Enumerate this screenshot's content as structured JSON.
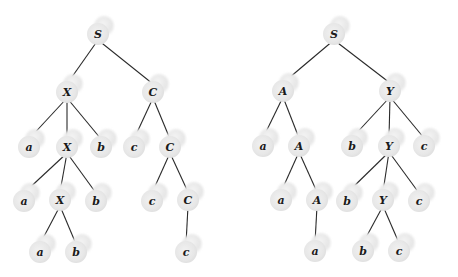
{
  "diagram": {
    "type": "parse-trees",
    "trees": [
      {
        "name": "left-tree",
        "nodes": [
          {
            "id": "L_S",
            "label": "S",
            "x": 98,
            "y": 34
          },
          {
            "id": "L_X1",
            "label": "X",
            "x": 67,
            "y": 92
          },
          {
            "id": "L_C1",
            "label": "C",
            "x": 153,
            "y": 92
          },
          {
            "id": "L_a1",
            "label": "a",
            "x": 29,
            "y": 147
          },
          {
            "id": "L_X2",
            "label": "X",
            "x": 67,
            "y": 147
          },
          {
            "id": "L_b1",
            "label": "b",
            "x": 101,
            "y": 147
          },
          {
            "id": "L_c1",
            "label": "c",
            "x": 134,
            "y": 147
          },
          {
            "id": "L_C2",
            "label": "C",
            "x": 170,
            "y": 147
          },
          {
            "id": "L_a2",
            "label": "a",
            "x": 24,
            "y": 201
          },
          {
            "id": "L_X3",
            "label": "X",
            "x": 60,
            "y": 200
          },
          {
            "id": "L_b2",
            "label": "b",
            "x": 96,
            "y": 201
          },
          {
            "id": "L_c2",
            "label": "c",
            "x": 152,
            "y": 201
          },
          {
            "id": "L_C3",
            "label": "C",
            "x": 188,
            "y": 200
          },
          {
            "id": "L_a3",
            "label": "a",
            "x": 40,
            "y": 252
          },
          {
            "id": "L_b3",
            "label": "b",
            "x": 76,
            "y": 252
          },
          {
            "id": "L_c3",
            "label": "c",
            "x": 186,
            "y": 252
          }
        ],
        "edges": [
          [
            "L_S",
            "L_X1"
          ],
          [
            "L_S",
            "L_C1"
          ],
          [
            "L_X1",
            "L_a1"
          ],
          [
            "L_X1",
            "L_X2"
          ],
          [
            "L_X1",
            "L_b1"
          ],
          [
            "L_C1",
            "L_c1"
          ],
          [
            "L_C1",
            "L_C2"
          ],
          [
            "L_X2",
            "L_a2"
          ],
          [
            "L_X2",
            "L_X3"
          ],
          [
            "L_X2",
            "L_b2"
          ],
          [
            "L_C2",
            "L_c2"
          ],
          [
            "L_C2",
            "L_C3"
          ],
          [
            "L_X3",
            "L_a3"
          ],
          [
            "L_X3",
            "L_b3"
          ],
          [
            "L_C3",
            "L_c3"
          ]
        ]
      },
      {
        "name": "right-tree",
        "nodes": [
          {
            "id": "R_S",
            "label": "S",
            "x": 334,
            "y": 34
          },
          {
            "id": "R_A1",
            "label": "A",
            "x": 283,
            "y": 91
          },
          {
            "id": "R_Y1",
            "label": "Y",
            "x": 390,
            "y": 91
          },
          {
            "id": "R_a1",
            "label": "a",
            "x": 263,
            "y": 146
          },
          {
            "id": "R_A2",
            "label": "A",
            "x": 299,
            "y": 146
          },
          {
            "id": "R_b1",
            "label": "b",
            "x": 352,
            "y": 146
          },
          {
            "id": "R_Y2",
            "label": "Y",
            "x": 389,
            "y": 146
          },
          {
            "id": "R_c1",
            "label": "c",
            "x": 424,
            "y": 146
          },
          {
            "id": "R_a2",
            "label": "a",
            "x": 281,
            "y": 200
          },
          {
            "id": "R_A3",
            "label": "A",
            "x": 317,
            "y": 200
          },
          {
            "id": "R_b2",
            "label": "b",
            "x": 347,
            "y": 201
          },
          {
            "id": "R_Y3",
            "label": "Y",
            "x": 383,
            "y": 200
          },
          {
            "id": "R_c2",
            "label": "c",
            "x": 419,
            "y": 201
          },
          {
            "id": "R_a3",
            "label": "a",
            "x": 315,
            "y": 251
          },
          {
            "id": "R_b3",
            "label": "b",
            "x": 363,
            "y": 251
          },
          {
            "id": "R_c3",
            "label": "c",
            "x": 399,
            "y": 251
          }
        ],
        "edges": [
          [
            "R_S",
            "R_A1"
          ],
          [
            "R_S",
            "R_Y1"
          ],
          [
            "R_A1",
            "R_a1"
          ],
          [
            "R_A1",
            "R_A2"
          ],
          [
            "R_Y1",
            "R_b1"
          ],
          [
            "R_Y1",
            "R_Y2"
          ],
          [
            "R_Y1",
            "R_c1"
          ],
          [
            "R_A2",
            "R_a2"
          ],
          [
            "R_A2",
            "R_A3"
          ],
          [
            "R_Y2",
            "R_b2"
          ],
          [
            "R_Y2",
            "R_Y3"
          ],
          [
            "R_Y2",
            "R_c2"
          ],
          [
            "R_A3",
            "R_a3"
          ],
          [
            "R_Y3",
            "R_b3"
          ],
          [
            "R_Y3",
            "R_c3"
          ]
        ]
      }
    ]
  }
}
